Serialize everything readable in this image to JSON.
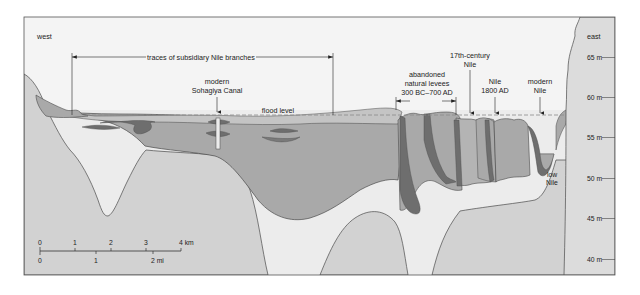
{
  "diagram": {
    "type": "geological cross-section",
    "orientation": {
      "left": "west",
      "right": "east"
    },
    "labels": {
      "west": "west",
      "east": "east",
      "subsidiary_branches": "traces of subsidiary Nile branches",
      "canal_line1": "modern",
      "canal_line2": "Sohagiya Canal",
      "flood_level": "flood level",
      "levees_line1": "abandoned",
      "levees_line2": "natural levees",
      "levees_line3": "300 BC–700 AD",
      "nile17_line1": "17th-century",
      "nile17_line2": "Nile",
      "nile1800_line1": "Nile",
      "nile1800_line2": "1800 AD",
      "modern_nile_line1": "modern",
      "modern_nile_line2": "Nile",
      "low_nile_line1": "low",
      "low_nile_line2": "Nile"
    },
    "elevation_axis": {
      "unit": "m",
      "ticks": [
        "65 m",
        "60 m",
        "55 m",
        "50 m",
        "45 m",
        "40 m"
      ]
    },
    "scale_bar": {
      "km_ticks": [
        "0",
        "1",
        "2",
        "3",
        "4 km"
      ],
      "mi_ticks": [
        "0",
        "1",
        "2 mi"
      ]
    },
    "colors": {
      "sky": "#f4f4f4",
      "bedrock_light": "#d2d2d2",
      "sand_pale": "#ececec",
      "alluvium_mid": "#a9a9a9",
      "levee_light": "#b8b8b8",
      "dark_clay": "#6e6e6e",
      "east_cliff": "#dcdcdc",
      "outline": "#4a4a4a",
      "flood_dash": "#8a8a8a"
    }
  }
}
